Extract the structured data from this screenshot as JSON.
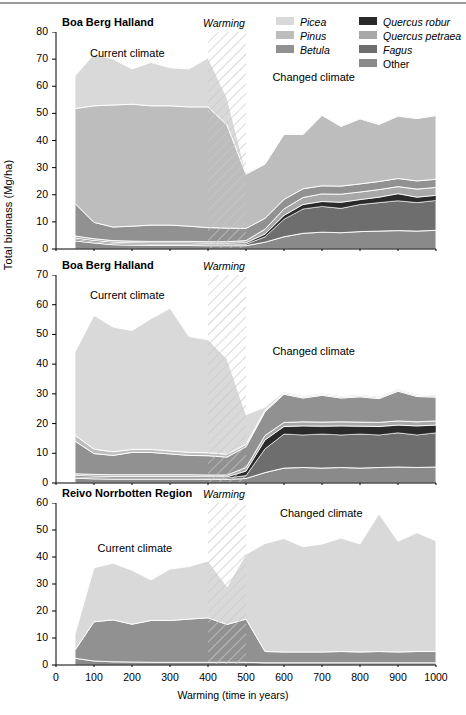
{
  "figure": {
    "y_axis_title": "Total biomass (Mg/ha)",
    "x_axis_title": "Warming (time in years)",
    "x_ticks": [
      0,
      100,
      200,
      300,
      400,
      500,
      600,
      700,
      800,
      900,
      1000
    ],
    "warming_label": "Warming",
    "current_climate_label": "Current climate",
    "changed_climate_label": "Changed climate",
    "warming_band": [
      400,
      500
    ]
  },
  "legend": {
    "position": "top-right",
    "columns": 2,
    "entries": [
      {
        "label": "Picea",
        "color": "#d9d9d9"
      },
      {
        "label": "Pinus",
        "color": "#bdbdbd"
      },
      {
        "label": "Betula",
        "color": "#919191"
      },
      {
        "label": "Quercus robur",
        "color": "#2a2a2a"
      },
      {
        "label": "Quercus petraea",
        "color": "#a8a8a8"
      },
      {
        "label": "Fagus",
        "color": "#6e6e6e"
      },
      {
        "label": "Other",
        "color": "#8a8a8a"
      }
    ]
  },
  "chart_data": [
    {
      "type": "area",
      "stacked": true,
      "title": "Boa Berg Halland",
      "xlabel": "Warming (time in years)",
      "ylabel": "Total biomass (Mg/ha)",
      "xlim": [
        0,
        1000
      ],
      "ylim": [
        0,
        80
      ],
      "yticks": [
        0,
        10,
        20,
        30,
        40,
        50,
        60,
        70,
        80
      ],
      "grid": false,
      "x": [
        50,
        100,
        150,
        200,
        250,
        300,
        350,
        400,
        450,
        500,
        550,
        600,
        650,
        700,
        750,
        800,
        850,
        900,
        950,
        1000
      ],
      "series": [
        {
          "name": "Other",
          "color": "#8a8a8a",
          "values": [
            3.0,
            2.2,
            1.6,
            1.4,
            1.3,
            1.3,
            1.3,
            1.2,
            1.2,
            1.2,
            2.5,
            4.5,
            5.8,
            6.2,
            6.0,
            6.4,
            6.6,
            6.8,
            6.6,
            6.9
          ]
        },
        {
          "name": "Fagus",
          "color": "#6e6e6e",
          "values": [
            0.6,
            0.5,
            0.5,
            0.5,
            0.5,
            0.5,
            0.5,
            0.5,
            0.5,
            0.6,
            2.0,
            6.5,
            9.0,
            9.5,
            9.0,
            10.0,
            10.5,
            11.0,
            10.5,
            11.0
          ]
        },
        {
          "name": "Quercus robur",
          "color": "#2a2a2a",
          "values": [
            0.4,
            0.4,
            0.4,
            0.4,
            0.4,
            0.4,
            0.4,
            0.4,
            0.4,
            0.5,
            1.0,
            1.4,
            1.6,
            1.8,
            2.2,
            1.8,
            2.0,
            2.6,
            2.0,
            1.9
          ]
        },
        {
          "name": "Quercus petraea",
          "color": "#a8a8a8",
          "values": [
            0.8,
            0.7,
            0.6,
            0.6,
            0.6,
            0.6,
            0.6,
            0.6,
            0.6,
            0.8,
            1.8,
            2.4,
            2.6,
            2.8,
            3.0,
            2.8,
            2.8,
            2.6,
            3.0,
            2.9
          ]
        },
        {
          "name": "Betula",
          "color": "#919191",
          "values": [
            12.0,
            6.0,
            5.0,
            5.5,
            6.0,
            6.0,
            5.6,
            5.2,
            5.0,
            4.5,
            4.0,
            3.5,
            3.2,
            3.0,
            3.0,
            3.0,
            3.0,
            3.0,
            3.0,
            3.0
          ]
        },
        {
          "name": "Pinus",
          "color": "#bdbdbd",
          "values": [
            35.0,
            43.0,
            45.0,
            45.0,
            44.0,
            44.0,
            44.0,
            44.5,
            38.0,
            20.0,
            20.0,
            24.0,
            20.0,
            26.0,
            22.0,
            24.0,
            21.0,
            23.0,
            23.0,
            23.5
          ]
        },
        {
          "name": "Picea",
          "color": "#d9d9d9",
          "values": [
            12.0,
            19.0,
            17.0,
            13.0,
            16.0,
            14.0,
            14.0,
            18.0,
            10.0,
            0.5,
            0.3,
            0.3,
            0.3,
            0.3,
            0.3,
            0.3,
            0.3,
            0.3,
            0.3,
            0.3
          ]
        }
      ],
      "annotations": [
        {
          "text": "Current climate",
          "x": 200,
          "y": 72
        },
        {
          "text": "Changed climate",
          "x": 680,
          "y": 63
        },
        {
          "text": "Warming",
          "x": 450,
          "y": 79,
          "style": "italic"
        }
      ]
    },
    {
      "type": "area",
      "stacked": true,
      "title": "Boa Berg Halland",
      "xlabel": "Warming (time in years)",
      "ylabel": "Total biomass (Mg/ha)",
      "xlim": [
        0,
        1000
      ],
      "ylim": [
        0,
        70
      ],
      "yticks": [
        0,
        10,
        20,
        30,
        40,
        50,
        60,
        70
      ],
      "grid": false,
      "x": [
        50,
        100,
        150,
        200,
        250,
        300,
        350,
        400,
        450,
        500,
        550,
        600,
        650,
        700,
        750,
        800,
        850,
        900,
        950,
        1000
      ],
      "series": [
        {
          "name": "Other",
          "color": "#8a8a8a",
          "values": [
            1.6,
            1.4,
            1.3,
            1.3,
            1.3,
            1.3,
            1.3,
            1.2,
            1.2,
            1.5,
            3.5,
            5.0,
            5.2,
            5.0,
            5.2,
            5.0,
            5.2,
            5.4,
            5.2,
            5.4
          ]
        },
        {
          "name": "Fagus",
          "color": "#6e6e6e",
          "values": [
            0.5,
            0.5,
            0.5,
            0.5,
            0.5,
            0.5,
            0.5,
            0.5,
            0.5,
            1.0,
            8.0,
            11.5,
            11.0,
            11.5,
            11.0,
            11.5,
            11.0,
            11.5,
            11.0,
            11.5
          ]
        },
        {
          "name": "Quercus robur",
          "color": "#2a2a2a",
          "values": [
            0.4,
            0.4,
            0.4,
            0.4,
            0.4,
            0.4,
            0.4,
            0.4,
            0.4,
            1.5,
            3.0,
            2.5,
            3.0,
            2.6,
            3.0,
            2.6,
            2.8,
            2.6,
            3.0,
            2.6
          ]
        },
        {
          "name": "Quercus petraea",
          "color": "#a8a8a8",
          "values": [
            0.6,
            0.6,
            0.6,
            0.6,
            0.6,
            0.6,
            0.6,
            0.6,
            0.6,
            1.2,
            1.5,
            1.4,
            1.4,
            1.4,
            1.4,
            1.4,
            1.4,
            1.4,
            1.4,
            1.4
          ]
        },
        {
          "name": "Betula",
          "color": "#919191",
          "values": [
            11.0,
            7.0,
            6.5,
            7.5,
            7.5,
            7.0,
            6.5,
            6.5,
            6.0,
            7.0,
            8.0,
            9.5,
            8.0,
            9.0,
            8.0,
            8.5,
            8.0,
            10.0,
            8.5,
            8.0
          ]
        },
        {
          "name": "Pinus",
          "color": "#bdbdbd",
          "values": [
            2.0,
            1.5,
            1.2,
            1.0,
            1.0,
            1.0,
            1.0,
            1.0,
            1.0,
            0.8,
            0.5,
            0.4,
            0.4,
            0.4,
            0.4,
            0.4,
            0.4,
            0.4,
            0.4,
            0.4
          ]
        },
        {
          "name": "Picea",
          "color": "#d9d9d9",
          "values": [
            28.0,
            45.0,
            42.0,
            40.0,
            44.0,
            48.0,
            39.0,
            38.0,
            32.0,
            10.0,
            1.0,
            0.4,
            0.4,
            0.4,
            0.4,
            0.4,
            0.4,
            0.4,
            0.4,
            0.4
          ]
        }
      ],
      "annotations": [
        {
          "text": "Current climate",
          "x": 200,
          "y": 63
        },
        {
          "text": "Changed climate",
          "x": 680,
          "y": 44
        },
        {
          "text": "Warming",
          "x": 450,
          "y": 69,
          "style": "italic"
        }
      ]
    },
    {
      "type": "area",
      "stacked": true,
      "title": "Reivo Norrbotten Region",
      "xlabel": "Warming (time in years)",
      "ylabel": "Total biomass (Mg/ha)",
      "xlim": [
        0,
        1000
      ],
      "ylim": [
        0,
        60
      ],
      "yticks": [
        0,
        10,
        20,
        30,
        40,
        50,
        60
      ],
      "grid": false,
      "x": [
        50,
        100,
        150,
        200,
        250,
        300,
        350,
        400,
        450,
        500,
        550,
        600,
        650,
        700,
        750,
        800,
        850,
        900,
        950,
        1000
      ],
      "series": [
        {
          "name": "Other",
          "color": "#8a8a8a",
          "values": [
            2.5,
            1.5,
            1.2,
            1.1,
            1.0,
            1.0,
            1.0,
            1.0,
            1.0,
            1.0,
            0.8,
            0.8,
            0.8,
            0.8,
            0.8,
            0.8,
            0.8,
            0.8,
            0.8,
            0.8
          ]
        },
        {
          "name": "Betula",
          "color": "#919191",
          "values": [
            3.0,
            14.5,
            15.5,
            14.0,
            15.5,
            15.5,
            16.0,
            16.5,
            14.0,
            16.0,
            4.2,
            4.0,
            4.0,
            4.0,
            4.2,
            4.0,
            4.2,
            4.0,
            4.2,
            4.2
          ]
        },
        {
          "name": "Picea",
          "color": "#d9d9d9",
          "values": [
            6.0,
            20.0,
            21.0,
            20.0,
            15.0,
            19.0,
            19.5,
            21.0,
            14.0,
            24.0,
            40.0,
            42.0,
            39.0,
            40.0,
            42.0,
            40.0,
            51.0,
            41.0,
            44.0,
            41.0
          ]
        }
      ],
      "annotations": [
        {
          "text": "Current climate",
          "x": 220,
          "y": 43
        },
        {
          "text": "Changed climate",
          "x": 700,
          "y": 56
        },
        {
          "text": "Warming",
          "x": 450,
          "y": 60,
          "style": "italic"
        }
      ]
    }
  ]
}
